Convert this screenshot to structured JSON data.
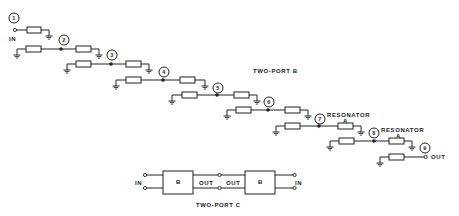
{
  "diagram": {
    "type": "ladder-network schematic",
    "nodes": [
      "1",
      "2",
      "3",
      "4",
      "5",
      "6",
      "7",
      "8",
      "9"
    ],
    "labels": {
      "in": "IN",
      "out": "OUT",
      "two_port_b": "TWO-PORT B",
      "two_port_c": "TWO-PORT C",
      "resonator": "RESONATOR",
      "resonator_sub": "A"
    },
    "two_port_c": {
      "left_block": "B",
      "right_block": "B",
      "left_in": "IN",
      "left_out": "OUT",
      "right_out": "OUT",
      "right_in": "IN"
    }
  }
}
